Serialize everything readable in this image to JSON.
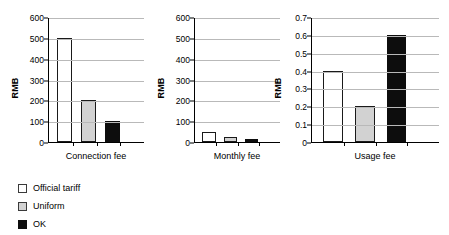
{
  "chart_data": [
    {
      "type": "bar",
      "title": "",
      "xlabel": "Connection fee",
      "ylabel": "RMB",
      "categories": [
        "Connection fee"
      ],
      "ylim": [
        0,
        600
      ],
      "yticks": [
        0,
        100,
        200,
        300,
        400,
        500,
        600
      ],
      "yticklabels": [
        "0",
        "100",
        "200",
        "300",
        "400",
        "500",
        "600"
      ],
      "grid": true,
      "legend_position": "below-left-shared",
      "series": [
        {
          "name": "Official tariff",
          "color": "#ffffff",
          "values": [
            500
          ]
        },
        {
          "name": "Uniform",
          "color": "#d2d2d2",
          "values": [
            200
          ]
        },
        {
          "name": "OK",
          "color": "#0d0d0d",
          "values": [
            100
          ]
        }
      ]
    },
    {
      "type": "bar",
      "title": "",
      "xlabel": "Monthly fee",
      "ylabel": "RMB",
      "categories": [
        "Monthly fee"
      ],
      "ylim": [
        0,
        600
      ],
      "yticks": [
        0,
        100,
        200,
        300,
        400,
        500,
        600
      ],
      "yticklabels": [
        "0",
        "100",
        "200",
        "300",
        "400",
        "500",
        "600"
      ],
      "grid": true,
      "legend_position": "below-left-shared",
      "series": [
        {
          "name": "Official tariff",
          "color": "#ffffff",
          "values": [
            50
          ]
        },
        {
          "name": "Uniform",
          "color": "#d2d2d2",
          "values": [
            22
          ]
        },
        {
          "name": "OK",
          "color": "#0d0d0d",
          "values": [
            15
          ]
        }
      ]
    },
    {
      "type": "bar",
      "title": "",
      "xlabel": "Usage fee",
      "ylabel": "RMB",
      "categories": [
        "Usage fee"
      ],
      "ylim": [
        0,
        0.7
      ],
      "yticks": [
        0,
        0.1,
        0.2,
        0.3,
        0.4,
        0.5,
        0.6,
        0.7
      ],
      "yticklabels": [
        "0",
        "0.1",
        "0.2",
        "0.3",
        "0.4",
        "0.5",
        "0.6",
        "0.7"
      ],
      "grid": true,
      "legend_position": "below-left-shared",
      "series": [
        {
          "name": "Official tariff",
          "color": "#ffffff",
          "values": [
            0.4
          ]
        },
        {
          "name": "Uniform",
          "color": "#d2d2d2",
          "values": [
            0.2
          ]
        },
        {
          "name": "OK",
          "color": "#0d0d0d",
          "values": [
            0.6
          ]
        }
      ]
    }
  ],
  "legend": {
    "items": [
      {
        "label": "Official tariff",
        "swatch": "white"
      },
      {
        "label": "Uniform",
        "swatch": "gray"
      },
      {
        "label": "OK",
        "swatch": "black"
      }
    ]
  }
}
